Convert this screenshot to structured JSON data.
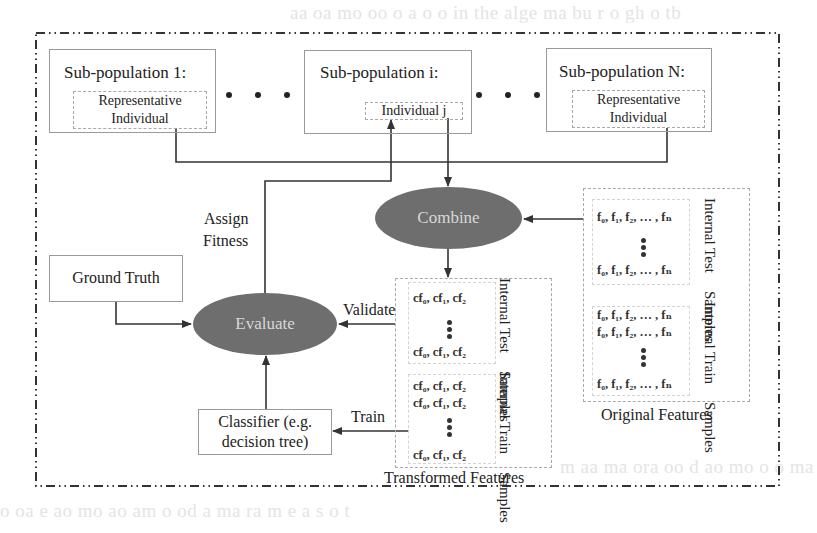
{
  "diagram": {
    "background_text": [
      "aa oa  mo oo o  a o o  in the  alge  ma bu  r  o  gh  o tb",
      "m  aa  ma  ora  oo d  ao  mo  o o ma  so oo  ra  m e oo  mo",
      "o   oa  e    ao mo    ao  am  o  od  a ma  ra  m  e a s  o  t"
    ],
    "subpopulations": [
      {
        "title": "Sub-population 1:",
        "inner": [
          "Representative",
          "Individual"
        ]
      },
      {
        "title": "Sub-population i:",
        "inner": [
          "Individual j"
        ]
      },
      {
        "title": "Sub-population N:",
        "inner": [
          "Representative",
          "Individual"
        ]
      }
    ],
    "nodes": {
      "combine": "Combine",
      "evaluate": "Evaluate",
      "ground_truth": "Ground Truth",
      "classifier": [
        "Classifier (e.g.",
        "decision tree)"
      ]
    },
    "edge_labels": {
      "assign_fitness": [
        "Assign",
        "Fitness"
      ],
      "validate": "Validate",
      "train": "Train"
    },
    "original_features": {
      "caption": "Original Features",
      "test": {
        "label": [
          "Internal Test",
          "Samples"
        ],
        "rows": [
          "f₀, f₁, f₂, … , fₙ",
          "f₀, f₁, f₂, … , fₙ"
        ]
      },
      "train": {
        "label": [
          "Internal Train",
          "Samples"
        ],
        "rows": [
          "f₀, f₁, f₂, … , fₙ",
          "f₀, f₁, f₂, … , fₙ",
          "f₀, f₁, f₂, … , fₙ"
        ]
      }
    },
    "transformed_features": {
      "caption": "Transformed Features",
      "test": {
        "label": [
          "Internal Test",
          "Samples"
        ],
        "rows": [
          "cf₀, cf₁, cf₂",
          "cf₀, cf₁, cf₂"
        ]
      },
      "train": {
        "label": [
          "Internal Train",
          "Samples"
        ],
        "rows": [
          "cf₀, cf₁, cf₂",
          "cf₀, cf₁, cf₂",
          "cf₀, cf₁, cf₂"
        ]
      }
    },
    "colors": {
      "ellipse_fill": "#6e6e6e",
      "ellipse_text": "#d8d8d8",
      "line": "#333333"
    }
  }
}
